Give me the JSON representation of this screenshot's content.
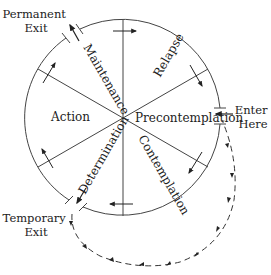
{
  "diagram": {
    "stages": {
      "relapse": "Relapse",
      "precontemplation": "Precontemplation",
      "contemplation": "Contemplation",
      "determination": "Determination",
      "action": "Action",
      "maintenance": "Maintenance"
    },
    "labels": {
      "permanent_exit_line1": "Permanent",
      "permanent_exit_line2": "Exit",
      "enter_here_line1": "Enter",
      "enter_here_line2": "Here",
      "temporary_exit_line1": "Temporary",
      "temporary_exit_line2": "Exit"
    },
    "colors": {
      "stroke": "#333333",
      "text": "#222222",
      "background": "#ffffff"
    }
  }
}
